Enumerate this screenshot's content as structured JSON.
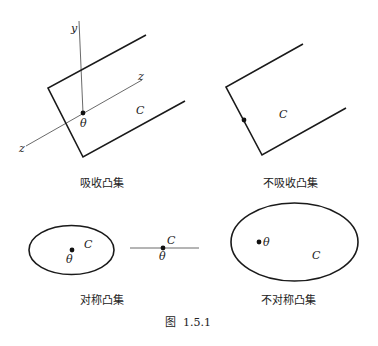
{
  "figure": {
    "label": "图  1.5.1",
    "panels": [
      {
        "id": "absorbing",
        "caption": "吸收凸集",
        "set_label": "C",
        "origin_label": "θ",
        "axes": {
          "y_label": "y",
          "z_label_1": "z",
          "z_label_2": "z"
        }
      },
      {
        "id": "non-absorbing",
        "caption": "不吸收凸集",
        "set_label": "C"
      },
      {
        "id": "symmetric",
        "caption": "对称凸集",
        "ellipse": {
          "set_label": "C",
          "origin_label": "θ"
        },
        "segment": {
          "set_label": "C",
          "origin_label": "θ"
        }
      },
      {
        "id": "non-symmetric",
        "caption": "不对称凸集",
        "set_label": "C",
        "origin_label": "θ"
      }
    ]
  }
}
